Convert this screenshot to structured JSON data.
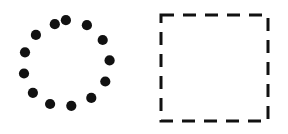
{
  "canvas": {
    "width": 288,
    "height": 134,
    "background_color": "#ffffff",
    "ink_color": "#111111"
  },
  "figures": [
    {
      "name": "dotted-circle",
      "label": "Circle of dots",
      "shape": "ring-of-dots",
      "color": "#111111",
      "center_x": 70,
      "center_y": 67,
      "radius": 47,
      "dot_count": 13,
      "dot_radius": 5.1,
      "start_angle_deg": -95,
      "dots": [
        {
          "cx": 65.9,
          "cy": 20.2
        },
        {
          "cx": 86.9,
          "cy": 25.2
        },
        {
          "cx": 102.7,
          "cy": 40.0
        },
        {
          "cx": 109.6,
          "cy": 60.4
        },
        {
          "cx": 105.3,
          "cy": 81.5
        },
        {
          "cx": 91.3,
          "cy": 97.9
        },
        {
          "cx": 71.3,
          "cy": 105.8
        },
        {
          "cx": 50.1,
          "cy": 104.0
        },
        {
          "cx": 32.9,
          "cy": 92.8
        },
        {
          "cx": 24.0,
          "cy": 73.5
        },
        {
          "cx": 25.0,
          "cy": 52.3
        },
        {
          "cx": 35.9,
          "cy": 34.9
        },
        {
          "cx": 54.8,
          "cy": 24.2
        }
      ]
    },
    {
      "name": "dashed-square",
      "label": "Dashed square",
      "shape": "dashed-rectangle",
      "color": "#111111",
      "x": 161,
      "y": 15,
      "width": 107,
      "height": 106,
      "stroke_width": 3,
      "dash_pattern": "13 9",
      "edges": {
        "top_dash_count": 5,
        "right_dash_count": 3,
        "bottom_dash_count": 5,
        "left_dash_count": 4
      }
    }
  ]
}
